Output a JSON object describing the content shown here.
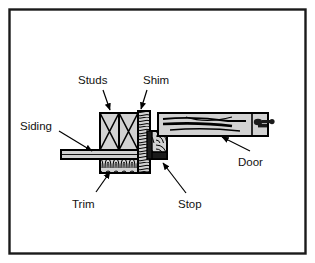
{
  "figure": {
    "border_color": "#1a1a1a",
    "background_color": "#ffffff",
    "line_color": "#000000",
    "fill_color": "#d2d2d2",
    "text_color": "#111111"
  },
  "labels": {
    "studs": "Studs",
    "shim": "Shim",
    "siding": "Siding",
    "trim": "Trim",
    "stop": "Stop",
    "door": "Door"
  },
  "parts": {
    "studs": {
      "name": "Studs",
      "count": 2,
      "hatch": "x-cross"
    },
    "shim": {
      "name": "Shim",
      "hatch": "wood-grain-vertical"
    },
    "siding": {
      "name": "Siding",
      "hatch": "plain-band"
    },
    "trim": {
      "name": "Trim",
      "hatch": "wood-grain-scallop"
    },
    "stop": {
      "name": "Stop",
      "hatch": "solid-dark"
    },
    "door": {
      "name": "Door",
      "hatch": "wood-grain-horizontal",
      "hardware": "latch"
    }
  }
}
